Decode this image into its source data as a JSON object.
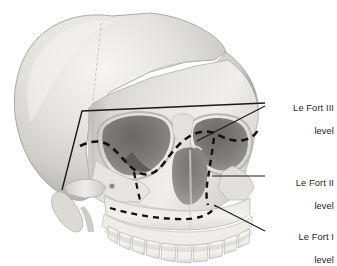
{
  "figure": {
    "background_color": "#ffffff",
    "text_color": "#231f20",
    "line_color": "#1a1a1a",
    "skull_tones": {
      "highlight": "#f2f1ef",
      "light": "#dedcd9",
      "mid": "#c3c1be",
      "shadow": "#9a9895",
      "deep_shadow": "#6f6d6b",
      "cavity": "#5d5b59",
      "outline": "#8c8a87",
      "tooth": "#f4f3f0",
      "tooth_line": "#b6b3af"
    }
  },
  "annotations": [
    {
      "id": "le-fort-3",
      "line1": "Le Fort III",
      "line2": "level",
      "line_style": "solid",
      "description": "high transverse craniofacial separation line crossing above the orbits and down the lateral orbital rim to the zygomatic root"
    },
    {
      "id": "le-fort-2",
      "line1": "Le Fort II",
      "line2": "level",
      "line_style": "dashed",
      "description": "pyramidal fracture line through nasofrontal region, medial and inferior orbital rims, down across the maxilla"
    },
    {
      "id": "le-fort-1",
      "line1": "Le Fort I",
      "line2": "level",
      "line_style": "dashed",
      "description": "horizontal fracture line above the maxillary tooth roots separating the lower maxilla"
    }
  ],
  "leaders": [
    {
      "id": "leader-le-fort-3-horizontal",
      "from": [
        82,
        111
      ],
      "to": [
        265,
        103
      ]
    },
    {
      "id": "leader-le-fort-3-diagonal",
      "from": [
        197,
        140
      ],
      "to": [
        265,
        106
      ]
    },
    {
      "id": "leader-le-fort-2",
      "from": [
        212,
        176
      ],
      "to": [
        265,
        176
      ]
    },
    {
      "id": "leader-le-fort-1",
      "from": [
        214,
        205
      ],
      "to": [
        265,
        231
      ]
    }
  ]
}
